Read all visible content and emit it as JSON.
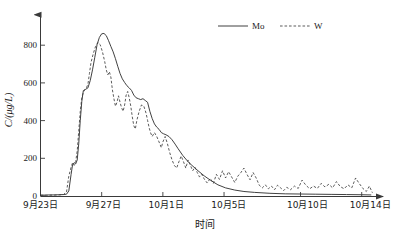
{
  "chart_data": {
    "type": "line",
    "title": "",
    "xlabel": "时间",
    "ylabel": "C/(μg/L)",
    "ylim": [
      0,
      960
    ],
    "yticks": [
      0,
      200,
      400,
      600,
      800
    ],
    "ytick_labels": [
      "0",
      "200",
      "400",
      "600",
      "800"
    ],
    "grid": false,
    "legend_position": "top-right",
    "x_axis_type": "date",
    "x_start_label": "9月23日",
    "x_end_label": "10月15日",
    "xtick_positions": [
      0,
      4,
      8,
      12,
      17,
      21
    ],
    "xtick_labels": [
      "9月23日",
      "9月27日",
      "10月1日",
      "10月5日",
      "10月10日",
      "10月14日"
    ],
    "x_unit": "days since 9月23日",
    "series": [
      {
        "name": "Mo",
        "style": "solid",
        "color": "#2b2b2b",
        "x": [
          0.0,
          0.3,
          0.6,
          0.9,
          1.2,
          1.5,
          1.7,
          1.85,
          2.0,
          2.1,
          2.2,
          2.3,
          2.4,
          2.5,
          2.6,
          2.7,
          2.8,
          2.95,
          3.1,
          3.25,
          3.4,
          3.55,
          3.7,
          3.85,
          4.0,
          4.15,
          4.3,
          4.45,
          4.6,
          4.75,
          4.9,
          5.05,
          5.2,
          5.35,
          5.5,
          5.65,
          5.8,
          5.95,
          6.1,
          6.25,
          6.4,
          6.55,
          6.7,
          6.85,
          7.0,
          7.15,
          7.3,
          7.45,
          7.6,
          7.75,
          7.9,
          8.05,
          8.2,
          8.4,
          8.6,
          8.8,
          9.0,
          9.3,
          9.6,
          9.9,
          10.3,
          10.7,
          11.1,
          11.6,
          12.1,
          12.7,
          13.3,
          14.0,
          15.0,
          16.0,
          17.0,
          18.0,
          19.0,
          20.0,
          21.0,
          21.6
        ],
        "y": [
          5,
          5,
          6,
          6,
          7,
          8,
          10,
          28,
          120,
          175,
          185,
          178,
          200,
          290,
          420,
          525,
          585,
          592,
          600,
          640,
          700,
          770,
          840,
          880,
          900,
          902,
          890,
          862,
          830,
          800,
          762,
          720,
          680,
          650,
          630,
          612,
          600,
          586,
          560,
          545,
          540,
          535,
          540,
          530,
          520,
          470,
          430,
          400,
          382,
          370,
          352,
          345,
          340,
          330,
          312,
          288,
          262,
          225,
          195,
          170,
          140,
          112,
          88,
          62,
          45,
          33,
          25,
          20,
          15,
          12,
          11,
          10,
          9,
          8,
          7,
          6
        ]
      },
      {
        "name": "W",
        "style": "dashed",
        "color": "#3d3d3d",
        "x": [
          0.0,
          0.4,
          0.8,
          1.2,
          1.5,
          1.7,
          1.85,
          2.0,
          2.1,
          2.2,
          2.3,
          2.4,
          2.5,
          2.6,
          2.7,
          2.8,
          2.9,
          3.0,
          3.1,
          3.2,
          3.3,
          3.45,
          3.6,
          3.75,
          3.9,
          4.05,
          4.2,
          4.3,
          4.4,
          4.5,
          4.6,
          4.7,
          4.8,
          4.9,
          5.0,
          5.1,
          5.2,
          5.3,
          5.4,
          5.5,
          5.6,
          5.7,
          5.8,
          5.9,
          6.0,
          6.1,
          6.2,
          6.3,
          6.45,
          6.6,
          6.75,
          6.9,
          7.0,
          7.1,
          7.2,
          7.3,
          7.45,
          7.6,
          7.75,
          7.9,
          8.0,
          8.15,
          8.3,
          8.45,
          8.6,
          8.75,
          8.9,
          9.05,
          9.2,
          9.35,
          9.5,
          9.65,
          9.8,
          9.95,
          10.1,
          10.25,
          10.4,
          10.55,
          10.7,
          10.9,
          11.1,
          11.3,
          11.5,
          11.7,
          11.9,
          12.1,
          12.3,
          12.5,
          12.7,
          12.9,
          13.1,
          13.3,
          13.5,
          13.7,
          13.9,
          14.1,
          14.3,
          14.5,
          14.7,
          14.9,
          15.1,
          15.3,
          15.5,
          15.7,
          15.9,
          16.1,
          16.35,
          16.6,
          16.85,
          17.1,
          17.35,
          17.6,
          17.85,
          18.1,
          18.35,
          18.6,
          18.85,
          19.1,
          19.35,
          19.6,
          19.85,
          20.1,
          20.35,
          20.6,
          20.85,
          21.1,
          21.3,
          21.5,
          21.7
        ],
        "y": [
          4,
          4,
          5,
          6,
          8,
          22,
          110,
          160,
          185,
          170,
          190,
          250,
          360,
          470,
          545,
          575,
          590,
          600,
          620,
          680,
          740,
          790,
          830,
          852,
          840,
          800,
          745,
          700,
          672,
          690,
          660,
          590,
          540,
          498,
          520,
          556,
          520,
          490,
          470,
          505,
          560,
          580,
          545,
          500,
          440,
          390,
          372,
          420,
          470,
          505,
          500,
          460,
          420,
          380,
          350,
          330,
          352,
          330,
          300,
          268,
          300,
          330,
          290,
          240,
          200,
          170,
          155,
          190,
          222,
          190,
          155,
          200,
          170,
          140,
          160,
          130,
          105,
          120,
          95,
          72,
          98,
          70,
          120,
          92,
          140,
          100,
          135,
          105,
          75,
          110,
          130,
          155,
          120,
          90,
          130,
          100,
          60,
          45,
          62,
          40,
          55,
          35,
          60,
          45,
          30,
          48,
          35,
          55,
          42,
          88,
          60,
          40,
          55,
          42,
          70,
          50,
          65,
          45,
          80,
          52,
          40,
          62,
          45,
          100,
          68,
          40,
          25,
          55,
          18
        ]
      }
    ]
  },
  "legend": {
    "items": [
      {
        "label": "Mo",
        "style": "solid"
      },
      {
        "label": "W",
        "style": "dashed"
      }
    ]
  }
}
